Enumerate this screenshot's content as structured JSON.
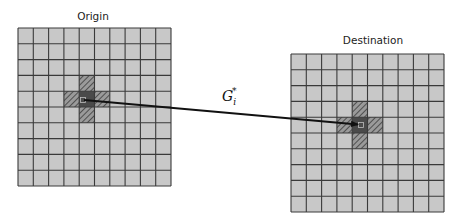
{
  "diagram": {
    "width": 459,
    "height": 221,
    "colors": {
      "cell_fill": "#c8c8c8",
      "grid_line": "#3a3a3a",
      "center_fill": "#4a4a4a",
      "hatch_fill": "#9a9a9a",
      "hatch_line": "#3c3c3c",
      "arrow": "#111111"
    },
    "grids": [
      {
        "id": "origin",
        "label": "Origin",
        "label_x": 93,
        "label_y": 10,
        "x": 18,
        "y": 28,
        "width": 153,
        "height": 158,
        "cols": 10,
        "rows": 10,
        "center_cell": [
          4,
          4
        ],
        "hatched_cells": [
          [
            4,
            3
          ],
          [
            3,
            4
          ],
          [
            5,
            4
          ],
          [
            4,
            5
          ]
        ],
        "marker": [
          83,
          100
        ]
      },
      {
        "id": "destination",
        "label": "Destination",
        "label_x": 373,
        "label_y": 34,
        "x": 291,
        "y": 54,
        "width": 153,
        "height": 158,
        "cols": 10,
        "rows": 10,
        "center_cell": [
          4,
          4
        ],
        "hatched_cells": [
          [
            4,
            3
          ],
          [
            3,
            4
          ],
          [
            5,
            4
          ],
          [
            4,
            5
          ]
        ],
        "marker": [
          361,
          125
        ]
      }
    ],
    "edge": {
      "from": [
        84,
        100
      ],
      "to": [
        358,
        124.5
      ],
      "label": {
        "base": "G",
        "subscript": "i",
        "superscript": "*",
        "x": 222,
        "y": 86
      }
    }
  }
}
